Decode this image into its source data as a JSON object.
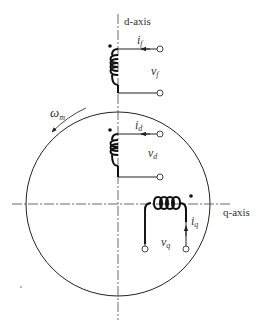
{
  "diagram": {
    "axes": {
      "d_axis_label": "d-axis",
      "q_axis_label": "q-axis"
    },
    "rotation": {
      "symbol": "ω",
      "subscript": "m"
    },
    "windings": [
      {
        "name": "field",
        "current": "i",
        "current_sub": "f",
        "voltage": "v",
        "voltage_sub": "f"
      },
      {
        "name": "d-axis",
        "current": "i",
        "current_sub": "d",
        "voltage": "v",
        "voltage_sub": "d"
      },
      {
        "name": "q-axis",
        "current": "i",
        "current_sub": "q",
        "voltage": "v",
        "voltage_sub": "q"
      }
    ],
    "colors": {
      "line": "#222222",
      "axis": "#444444"
    }
  }
}
